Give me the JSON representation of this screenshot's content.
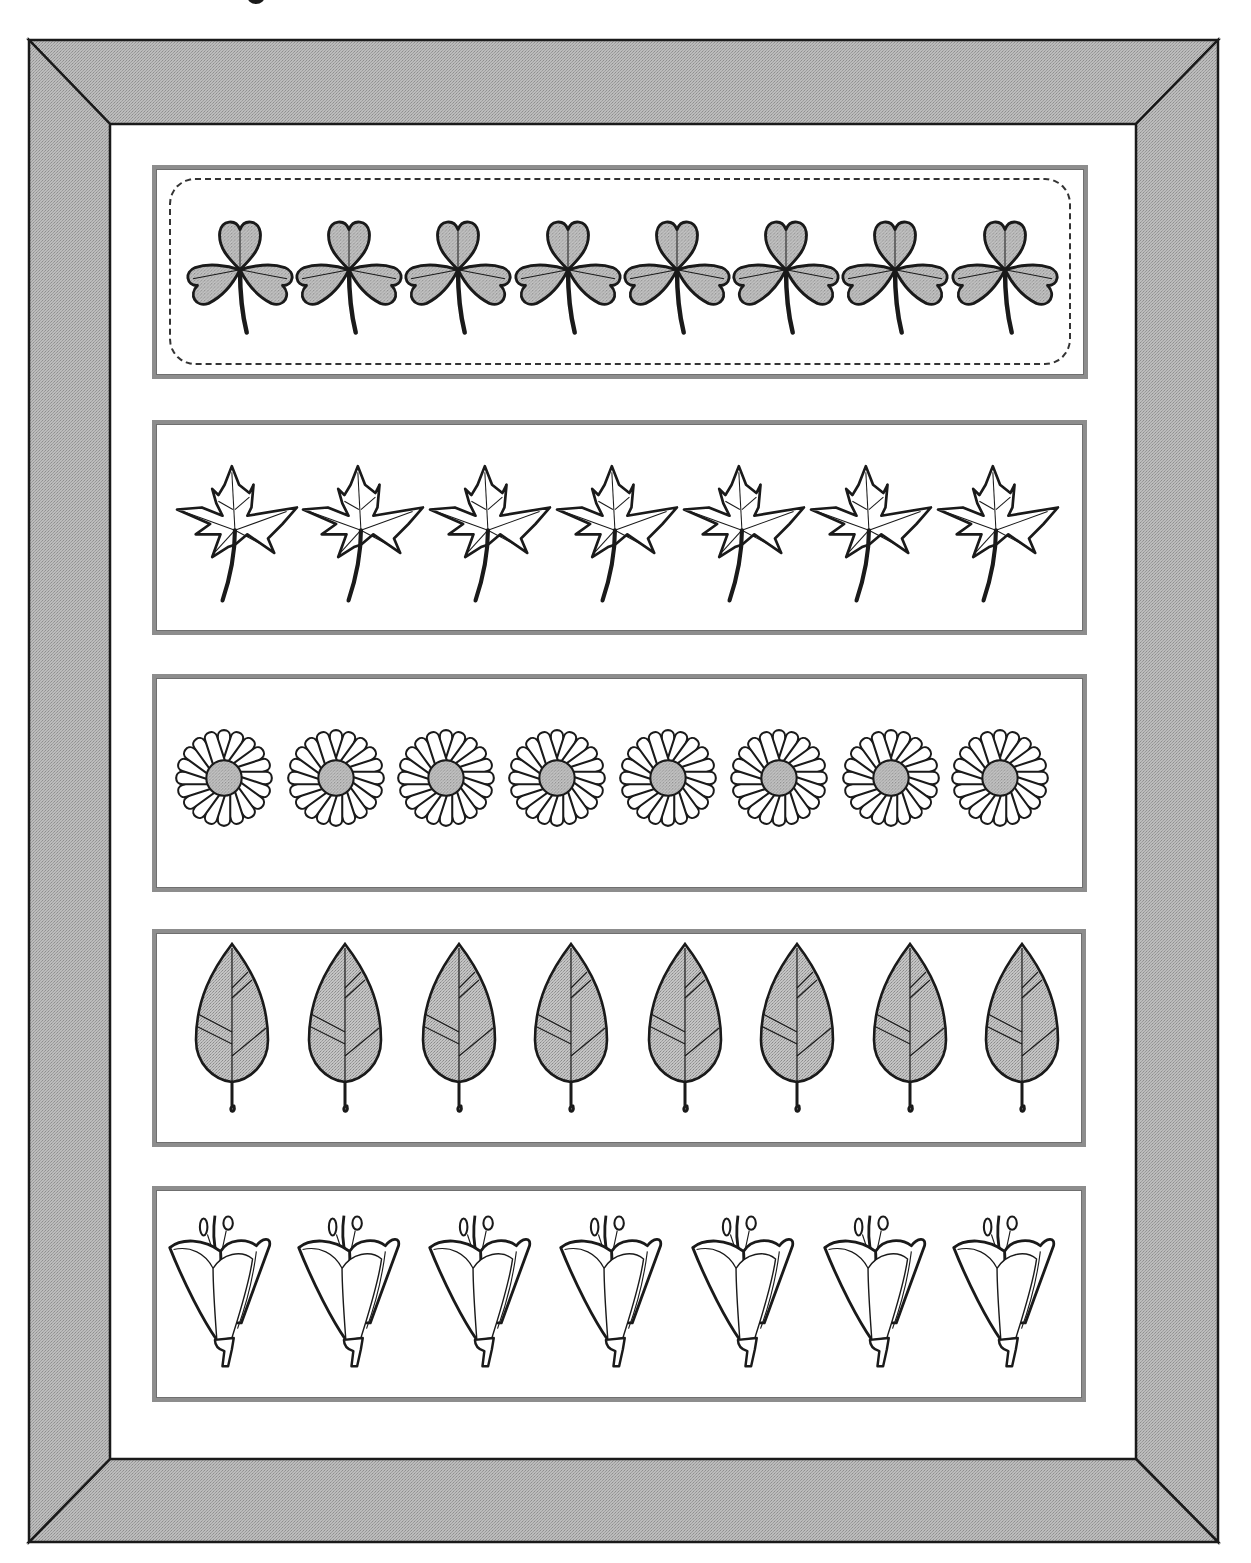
{
  "page": {
    "title_fragment": "g",
    "frame": {
      "outer": {
        "left": 29,
        "top": 40,
        "right": 1218,
        "bottom": 1542
      },
      "inner": {
        "left": 110,
        "top": 124,
        "right": 1136,
        "bottom": 1459
      },
      "fill": "#b4b4b4",
      "line": "#1a1a1a"
    },
    "colors": {
      "motif_fill": "#b0b0b0",
      "strip_border": "#8d8d8d",
      "ink": "#1a1a1a"
    }
  },
  "strips": [
    {
      "name": "clover-strip",
      "motif": "clover",
      "box": {
        "left": 152,
        "top": 165,
        "width": 936,
        "height": 214
      },
      "dashed_cut_line": true,
      "count": 8,
      "centers_x": [
        240,
        349,
        458,
        568,
        677,
        786,
        895,
        1005
      ],
      "center_y": 270,
      "size": 112
    },
    {
      "name": "maple-leaf-strip",
      "motif": "maple",
      "box": {
        "left": 152,
        "top": 420,
        "width": 935,
        "height": 215
      },
      "dashed_cut_line": false,
      "count": 7,
      "centers_x": [
        237,
        363,
        490,
        617,
        744,
        871,
        998
      ],
      "center_y": 530,
      "size": 124
    },
    {
      "name": "daisy-strip",
      "motif": "daisy",
      "box": {
        "left": 152,
        "top": 674,
        "width": 935,
        "height": 218
      },
      "dashed_cut_line": false,
      "count": 8,
      "centers_x": [
        224,
        336,
        446,
        557,
        668,
        779,
        891,
        1000
      ],
      "center_y": 778,
      "size": 104
    },
    {
      "name": "leaf-strip",
      "motif": "leaf",
      "box": {
        "left": 152,
        "top": 929,
        "width": 934,
        "height": 218
      },
      "dashed_cut_line": false,
      "count": 8,
      "centers_x": [
        232,
        345,
        459,
        571,
        685,
        797,
        910,
        1022
      ],
      "center_y": 1030,
      "size": 180
    },
    {
      "name": "lily-strip",
      "motif": "lily",
      "box": {
        "left": 152,
        "top": 1186,
        "width": 934,
        "height": 216
      },
      "dashed_cut_line": false,
      "count": 7,
      "centers_x": [
        222,
        351,
        482,
        613,
        745,
        877,
        1006
      ],
      "center_y": 1290,
      "size": 160
    }
  ],
  "icons": {
    "clover": "clover-icon",
    "maple": "maple-leaf-icon",
    "daisy": "daisy-icon",
    "leaf": "leaf-icon",
    "lily": "lily-icon"
  }
}
